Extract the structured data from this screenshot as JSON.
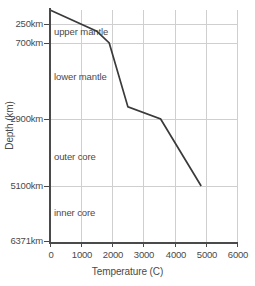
{
  "chart_data": {
    "type": "line",
    "title": "",
    "xlabel": "Temperature (C)",
    "ylabel": "Depth (km)",
    "xlim": [
      0,
      6000
    ],
    "ylim": [
      0,
      6371
    ],
    "y_inverted": true,
    "y_scale": "layer-proportional",
    "grid": true,
    "legend": null,
    "xticks": [
      0,
      1000,
      2000,
      3000,
      4000,
      5000,
      6000
    ],
    "xtick_labels": [
      "0",
      "1000",
      "2000",
      "3000",
      "4000",
      "5000",
      "6000"
    ],
    "yticks": [
      250,
      700,
      2900,
      5100,
      6371
    ],
    "ytick_labels": [
      "250km",
      "700km",
      "2900km",
      "5100km",
      "6371km"
    ],
    "series": [
      {
        "name": "geotherm",
        "points": [
          {
            "temperature": 0,
            "depth": 0
          },
          {
            "temperature": 1500,
            "depth": 420
          },
          {
            "temperature": 1900,
            "depth": 700
          },
          {
            "temperature": 2500,
            "depth": 2550
          },
          {
            "temperature": 3550,
            "depth": 2900
          },
          {
            "temperature": 4850,
            "depth": 5100
          }
        ]
      }
    ],
    "annotations": [
      {
        "text": "upper mantle",
        "temperature": 180,
        "depth": 430
      },
      {
        "text": "lower mantle",
        "temperature": 180,
        "depth": 1650
      },
      {
        "text": "outer core",
        "temperature": 180,
        "depth": 3950
      },
      {
        "text": "inner core",
        "temperature": 180,
        "depth": 5700
      }
    ]
  },
  "style": {
    "line_color": "#3a3a3a",
    "grid_color": "#cfcfcf",
    "axis_color": "#4a4a4a",
    "background": "#ffffff"
  }
}
